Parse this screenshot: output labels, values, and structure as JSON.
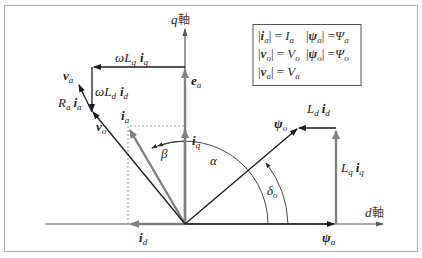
{
  "axes": {
    "d_axis": {
      "var": "d",
      "kanji": "軸"
    },
    "q_axis": {
      "var": "q",
      "kanji": "軸"
    }
  },
  "vectors": {
    "e_a": {
      "sym": "e",
      "sub": "a"
    },
    "i_a": {
      "sym": "i",
      "sub": "a"
    },
    "i_d": {
      "sym": "i",
      "sub": "d"
    },
    "i_q": {
      "sym": "i",
      "sub": "q"
    },
    "v_a": {
      "sym": "v",
      "sub": "a"
    },
    "v_o": {
      "sym": "v",
      "sub": "o"
    },
    "psi_a": {
      "sym": "ψ",
      "sub": "a"
    },
    "psi_o": {
      "sym": "ψ",
      "sub": "o"
    },
    "wLq_iq": {
      "coef": "ωL",
      "coef_sub": "q",
      "sym": "i",
      "sub": "q"
    },
    "wLd_id": {
      "coef": "ωL",
      "coef_sub": "d",
      "sym": "i",
      "sub": "d"
    },
    "Ra_ia": {
      "coef": "R",
      "coef_sub": "a",
      "sym": "i",
      "sub": "a"
    },
    "Ld_id": {
      "coef": "L",
      "coef_sub": "d",
      "sym": "i",
      "sub": "d"
    },
    "Lq_iq": {
      "coef": "L",
      "coef_sub": "q",
      "sym": "i",
      "sub": "q"
    }
  },
  "angles": {
    "alpha": "α",
    "beta": "β",
    "delta_o": {
      "sym": "δ",
      "sub": "o"
    }
  },
  "legend": {
    "rows": [
      {
        "lhs_sym": "i",
        "lhs_sub": "a",
        "rhs_sym": "I",
        "rhs_sub": "a"
      },
      {
        "lhs_sym": "v",
        "lhs_sub": "o",
        "rhs_sym": "V",
        "rhs_sub": "o"
      },
      {
        "lhs_sym": "v",
        "lhs_sub": "a",
        "rhs_sym": "V",
        "rhs_sub": "a"
      }
    ],
    "rows_right": [
      {
        "lhs_sym": "ψ",
        "lhs_sub": "a",
        "rhs_sym": "Ψ",
        "rhs_sub": "a"
      },
      {
        "lhs_sym": "ψ",
        "lhs_sub": "o",
        "rhs_sym": "Ψ",
        "rhs_sub": "o"
      }
    ]
  },
  "colors": {
    "current": "#808080",
    "voltage": "#1a1a1a",
    "frame": "#b4b4b4"
  }
}
